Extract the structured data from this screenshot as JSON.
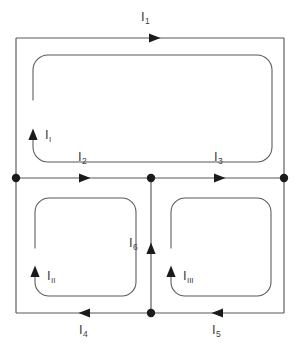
{
  "diagram": {
    "type": "circuit-schematic",
    "stroke_color": "#58585a",
    "node_color": "#1b1b1b",
    "label_color": "#404043",
    "background": "#ffffff"
  },
  "branch_currents": [
    {
      "id": "I1",
      "symbol": "I",
      "subscript": "1",
      "label": "I1",
      "direction": "right",
      "segment": "top-outer-wire"
    },
    {
      "id": "I2",
      "symbol": "I",
      "subscript": "2",
      "label": "I2",
      "direction": "right",
      "segment": "middle-wire-left"
    },
    {
      "id": "I3",
      "symbol": "I",
      "subscript": "3",
      "label": "I3",
      "direction": "right",
      "segment": "middle-wire-right"
    },
    {
      "id": "I4",
      "symbol": "I",
      "subscript": "4",
      "label": "I4",
      "direction": "left",
      "segment": "bottom-wire-left"
    },
    {
      "id": "I5",
      "symbol": "I",
      "subscript": "5",
      "label": "I5",
      "direction": "left",
      "segment": "bottom-wire-right"
    },
    {
      "id": "I6",
      "symbol": "I",
      "subscript": "6",
      "label": "I6",
      "direction": "up",
      "segment": "center-vertical-wire"
    }
  ],
  "mesh_currents": [
    {
      "id": "I_I",
      "symbol": "I",
      "subscript": "I",
      "label": "II",
      "direction": "counter-clockwise",
      "mesh": "top-loop"
    },
    {
      "id": "I_II",
      "symbol": "I",
      "subscript": "II",
      "label": "III",
      "direction": "counter-clockwise",
      "mesh": "bottom-left-loop"
    },
    {
      "id": "I_III",
      "symbol": "I",
      "subscript": "III",
      "label": "IIII",
      "direction": "counter-clockwise",
      "mesh": "bottom-right-loop"
    }
  ],
  "nodes": [
    {
      "id": "node-left",
      "x": 16,
      "y": 178
    },
    {
      "id": "node-center",
      "x": 151,
      "y": 178
    },
    {
      "id": "node-right",
      "x": 284,
      "y": 178
    },
    {
      "id": "node-bottom-center",
      "x": 151,
      "y": 313
    }
  ]
}
